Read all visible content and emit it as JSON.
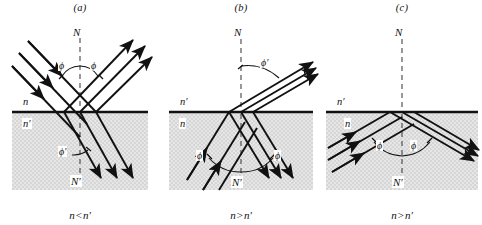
{
  "figure": {
    "background_color": "#ffffff",
    "ink_color": "#111111",
    "shaded_medium_color": "#e2e2e2"
  },
  "panels": [
    {
      "id": "a",
      "label": "(a)",
      "caption_left": "n",
      "caption_op": "<",
      "caption_right": "n′",
      "caption_full": "n < n′",
      "normal_top_label": "N",
      "normal_bottom_label": "N′",
      "upper_medium_label": "n",
      "lower_medium_label": "n′",
      "angle_incident_label": "ϕ",
      "angle_reflected_label": "ϕ",
      "angle_refracted_label": "ϕ′",
      "description": "Beam in rarer medium n strikes interface; reflected beam at equal angle phi, refracted beam bends toward the normal into denser medium n-prime."
    },
    {
      "id": "b",
      "label": "(b)",
      "caption_left": "n",
      "caption_op": ">",
      "caption_right": "n′",
      "caption_full": "n > n′",
      "normal_top_label": "N",
      "normal_bottom_label": "N′",
      "upper_medium_label": "n′",
      "lower_medium_label": "n",
      "angle_refracted_label": "ϕ′",
      "angle_incident_label": "ϕ",
      "angle_reflected_label": "ϕ",
      "description": "Beam travels upward inside denser medium n, refracts away from normal into rarer medium n-prime at large angle phi-prime."
    },
    {
      "id": "c",
      "label": "(c)",
      "caption_left": "n",
      "caption_op": ">",
      "caption_right": "n′",
      "caption_full": "n > n′",
      "normal_top_label": "N",
      "normal_bottom_label": "N′",
      "upper_medium_label": "n′",
      "lower_medium_label": "n",
      "angle_incident_label": "ϕ",
      "angle_reflected_label": "ϕ",
      "description": "Total internal reflection: beam inside denser medium n is entirely reflected back at equal angle phi; no transmitted ray in n-prime."
    }
  ],
  "geometry": {
    "interface_y": 112,
    "panel_width": 160,
    "panel_height": 225
  }
}
